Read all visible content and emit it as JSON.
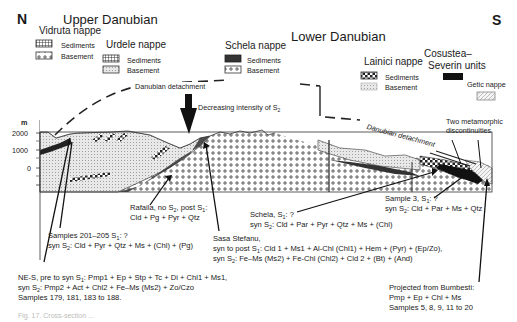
{
  "orientation": {
    "north": "N",
    "south": "S"
  },
  "headers": {
    "upper": "Upper Danubian",
    "lower": "Lower Danubian"
  },
  "legend": {
    "vidruta": {
      "title": "Vidruta nappe",
      "sediments": "Sediments",
      "basement": "Basement"
    },
    "urdele": {
      "title": "Urdele nappe",
      "sediments": "Sediments",
      "basement": "Basement"
    },
    "schela": {
      "title": "Schela nappe",
      "sediments": "Sediments",
      "basement": "Basement"
    },
    "lainici": {
      "title": "Lainici nappe",
      "sediments": "Sediments",
      "basement": "Basement"
    },
    "cosustea": {
      "title_line1": "Cosustea–",
      "title_line2": "Severin units"
    },
    "getic": {
      "title": "Getic nappe"
    }
  },
  "structures": {
    "detachment_top": "Danubian detachment",
    "detachment_right": "Danubian detachment",
    "s2_arrow": "Decreasing intensity of S",
    "s2_sub": "2",
    "discontinuities_line1": "Two metamorphic",
    "discontinuities_line2": "discontinuities"
  },
  "axis": {
    "unit": "m",
    "ticks": [
      "2000",
      "1000",
      "0"
    ]
  },
  "annotations": {
    "rafaila": {
      "l1a": "Rafaila, no S",
      "l1b": ", post S",
      "l1c": ":",
      "l2": "Cld + Pg + Pyr + Qtz"
    },
    "samples201": {
      "l1a": "Samples 201–205 S",
      "l1b": ": ?",
      "l2a": "syn S",
      "l2b": ": Cld + Pyr + Qtz + Ms + (Chl) + (Pg)"
    },
    "nes": {
      "l1a": "NE-S, pre to syn S",
      "l1b": ": Pmp1 + Ep + Stp + Tc + Di + Chl1 + Ms1,",
      "l2a": "syn S",
      "l2b": ": Pmp2 + Act + Chl2 + Fe–Ms (Ms2) + Zo/Czo",
      "l3": "Samples 179, 181, 183 to 188."
    },
    "schela": {
      "l1a": "Schela, S",
      "l1b": ": ?",
      "l2a": "syn S",
      "l2b": ": Cld + Par + Pyr + Qtz + Ms + (Chl)"
    },
    "sasa": {
      "l1": "Sasa Stefanu,",
      "l2a": "syn to post S",
      "l2b": ": Cld 1 + Ms1 + Al-Chl (Chl1) + Hem + (Pyr) + (Ep/Zo),",
      "l3a": "syn S",
      "l3b": ": Fe–Ms (Ms2) + Fe-Chl (Chl2) + Cld 2 + (Bt) + (And)"
    },
    "sample3": {
      "l1a": "Sample 3, S",
      "l1b": ": ?",
      "l2a": "syn S",
      "l2b": ": Cld + Par + Ms + Qtz"
    },
    "bumbesti": {
      "l1": "Projected from Bumbesti:",
      "l2": "Pmp + Ep + Chl + Ms",
      "l3": "Samples 5, 8, 9, 11 to 20"
    }
  },
  "subscripts": {
    "one": "1",
    "two": "2"
  },
  "caption": "Fig. 17. Cross-section ..."
}
